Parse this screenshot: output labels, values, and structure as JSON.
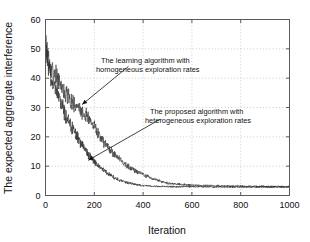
{
  "chart_data": {
    "type": "line",
    "title": "",
    "subtitle": "",
    "xlabel": "Iteration",
    "ylabel": "The expected aggregate interference",
    "xlim": [
      0,
      1000
    ],
    "ylim": [
      0,
      60
    ],
    "xticks": [
      0,
      200,
      400,
      600,
      800,
      1000
    ],
    "yticks": [
      0,
      10,
      20,
      30,
      40,
      50,
      60
    ],
    "xtick_labels": [
      "0",
      "200",
      "400",
      "600",
      "800",
      "1000"
    ],
    "ytick_labels": [
      "0",
      "10",
      "20",
      "30",
      "40",
      "50",
      "60"
    ],
    "grid": true,
    "grid_style": "dotted",
    "legend": "none",
    "legend_position": "annotations-with-arrows",
    "series": [
      {
        "name": "The learning algorithm with homogeneous exploration rates",
        "color": "#3a3a3a",
        "x": [
          0,
          10,
          20,
          30,
          40,
          50,
          60,
          70,
          80,
          90,
          100,
          120,
          140,
          160,
          180,
          200,
          220,
          240,
          260,
          280,
          300,
          320,
          340,
          360,
          380,
          400,
          420,
          440,
          460,
          480,
          500,
          550,
          600,
          650,
          700,
          750,
          800,
          850,
          900,
          950,
          1000
        ],
        "values": [
          52.0,
          47.5,
          44.0,
          42.5,
          41.0,
          39.5,
          38.0,
          36.5,
          35.0,
          34.0,
          33.0,
          31.0,
          29.5,
          28.0,
          26.0,
          23.5,
          20.5,
          18.0,
          16.0,
          14.0,
          12.5,
          11.0,
          9.8,
          8.8,
          8.0,
          7.2,
          6.4,
          5.8,
          5.2,
          4.6,
          4.2,
          3.8,
          3.5,
          3.4,
          3.3,
          3.2,
          3.2,
          3.1,
          3.1,
          3.1,
          3.0
        ]
      },
      {
        "name": "The proposed algorithm with heterogeneous exploration rates",
        "color": "#2b2b2b",
        "x": [
          0,
          10,
          20,
          30,
          40,
          50,
          60,
          70,
          80,
          90,
          100,
          120,
          140,
          160,
          180,
          200,
          220,
          240,
          260,
          280,
          300,
          320,
          340,
          360,
          380,
          400,
          420,
          440,
          460,
          480,
          500,
          550,
          600,
          650,
          700,
          750,
          800,
          850,
          900,
          950,
          1000
        ],
        "values": [
          50.0,
          45.0,
          41.0,
          38.5,
          36.0,
          34.0,
          32.0,
          30.0,
          28.0,
          26.0,
          24.5,
          21.5,
          18.5,
          16.0,
          13.5,
          11.5,
          9.8,
          8.4,
          7.2,
          6.2,
          5.4,
          4.8,
          4.3,
          3.9,
          3.6,
          3.4,
          3.3,
          3.2,
          3.1,
          3.1,
          3.0,
          3.0,
          3.0,
          3.0,
          2.9,
          2.9,
          2.9,
          2.9,
          2.9,
          2.9,
          2.9
        ]
      }
    ],
    "annotations": [
      {
        "id": "homogeneous",
        "line1": "The learning algorithm with",
        "line2": "homogeneous exploration rates",
        "arrow_from": [
          340,
          44
        ],
        "arrow_to": [
          150,
          31
        ]
      },
      {
        "id": "heterogeneous",
        "line1": "The proposed algorithm with",
        "line2": "heterogeneous exploration rates",
        "arrow_from": [
          470,
          26
        ],
        "arrow_to": [
          175,
          12
        ]
      }
    ]
  },
  "colors": {
    "axis": "#5a5a5a",
    "grid": "#b9b9b9",
    "text": "#111111",
    "background": "#ffffff",
    "series_a": "#3a3a3a",
    "series_b": "#2b2b2b"
  }
}
